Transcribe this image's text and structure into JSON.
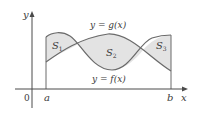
{
  "diagram": {
    "type": "area-between-curves",
    "axes": {
      "x_label": "x",
      "y_label": "y",
      "origin_label": "0"
    },
    "interval": {
      "start_label": "a",
      "end_label": "b"
    },
    "curves": [
      {
        "name": "upper",
        "label": "y = g(x)"
      },
      {
        "name": "lower",
        "label": "y = f(x)"
      }
    ],
    "regions": [
      {
        "label": "S",
        "subscript": "1"
      },
      {
        "label": "S",
        "subscript": "2"
      },
      {
        "label": "S",
        "subscript": "3"
      }
    ],
    "colors": {
      "fill": "#e3e3e3",
      "stroke": "#6a6a6a",
      "axis": "#4a4a4a",
      "text": "#3a3a3a"
    }
  }
}
